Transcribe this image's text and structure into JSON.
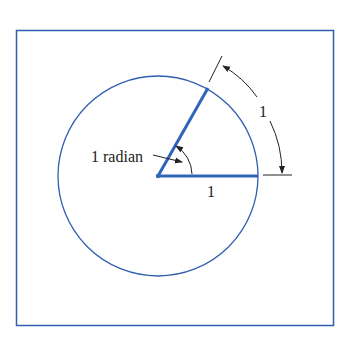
{
  "diagram": {
    "labels": {
      "angle": "1 radian",
      "radius": "1",
      "arc": "1"
    },
    "colors": {
      "frame": "#2f5fae",
      "circle": "#2f5fae",
      "radius_lines": "#2f64b8",
      "annotation": "#222222"
    },
    "geometry": {
      "center": [
        158,
        176
      ],
      "radius": 100,
      "angle_radians": 1
    }
  }
}
